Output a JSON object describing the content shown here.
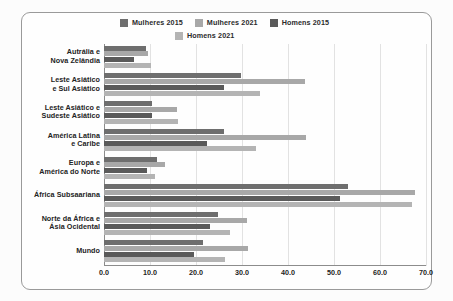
{
  "chart_data": {
    "type": "bar",
    "orientation": "horizontal",
    "title": "",
    "xlabel": "",
    "ylabel": "",
    "xlim": [
      0.0,
      70.0
    ],
    "xticks": [
      "0.0",
      "10.0",
      "20.0",
      "30.0",
      "40.0",
      "50.0",
      "60.0",
      "70.0"
    ],
    "xtick_values": [
      0,
      10,
      20,
      30,
      40,
      50,
      60,
      70
    ],
    "grid": true,
    "legend_position": "top",
    "categories": [
      "Austrália e Nova Zelândia",
      "Leste Asiático e Sul Asiático",
      "Leste Asiático e Sudeste Asiático",
      "América Latina e Caribe",
      "Europa e América do Norte",
      "África Subsaariana",
      "Norte da África e Ásia Ocidental",
      "Mundo"
    ],
    "series": [
      {
        "name": "Mulheres 2015",
        "color": "#6e6e6e",
        "values": [
          9.1,
          29.8,
          10.4,
          26.0,
          11.5,
          53.0,
          24.8,
          21.5
        ]
      },
      {
        "name": "Mulheres 2021",
        "color": "#a8a8a8",
        "values": [
          9.6,
          43.7,
          15.9,
          44.0,
          13.3,
          67.6,
          31.1,
          31.3
        ]
      },
      {
        "name": "Homens 2015",
        "color": "#5a5a5a",
        "values": [
          6.5,
          26.0,
          10.4,
          22.4,
          9.3,
          51.3,
          23.0,
          19.6
        ]
      },
      {
        "name": "Homens 2021",
        "color": "#b4b4b4",
        "values": [
          10.2,
          34.0,
          16.1,
          33.0,
          11.1,
          67.0,
          27.4,
          26.3
        ]
      }
    ]
  },
  "legend": {
    "items": [
      {
        "label": "Mulheres 2015",
        "swatch": "#6e6e6e"
      },
      {
        "label": "Mulheres 2021",
        "swatch": "#a8a8a8"
      },
      {
        "label": "Homens 2015",
        "swatch": "#5a5a5a"
      },
      {
        "label": "Homens 2021",
        "swatch": "#b4b4b4"
      }
    ]
  },
  "category_lines": [
    [
      "Autrália e",
      "Nova Zelândia"
    ],
    [
      "Leste Asiático",
      "e Sul Asiático"
    ],
    [
      "Leste Asiático e",
      "Sudeste Asiático"
    ],
    [
      "América Latina",
      "e Caribe"
    ],
    [
      "Europa e",
      "América do Norte"
    ],
    [
      "África Subsaariana"
    ],
    [
      "Norte da África e",
      "Ásia Ocidental"
    ],
    [
      "Mundo"
    ]
  ]
}
